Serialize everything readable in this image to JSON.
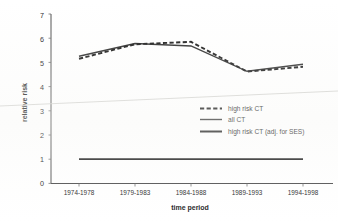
{
  "chart_data": {
    "type": "line",
    "title": "",
    "xlabel": "time period",
    "ylabel": "relative risk",
    "categories": [
      "1974-1978",
      "1979-1983",
      "1984-1988",
      "1989-1993",
      "1994-1998"
    ],
    "ylim": [
      0,
      7
    ],
    "yticks": [
      0,
      1,
      2,
      3,
      4,
      5,
      6,
      7
    ],
    "ytick_labels": [
      "0",
      "1",
      "2",
      "3",
      "4",
      "5",
      "6",
      "7"
    ],
    "grid": false,
    "legend_position": "center-right",
    "series": [
      {
        "name": "high risk CT",
        "style": "dashed",
        "color": "#161616",
        "values": [
          5.15,
          5.75,
          5.85,
          4.62,
          4.82
        ]
      },
      {
        "name": "all CT",
        "style": "solid",
        "color": "#2a2a2a",
        "values": [
          5.25,
          5.78,
          5.68,
          4.63,
          4.92
        ]
      },
      {
        "name": "high risk CT (adj. for SES)",
        "style": "solid-thick",
        "color": "#1c1c1c",
        "values": [
          1.0,
          1.0,
          1.0,
          1.0,
          1.0
        ]
      }
    ]
  },
  "legend": {
    "items": [
      {
        "label": "high risk CT",
        "style": "dashed"
      },
      {
        "label": "all CT",
        "style": "solid"
      },
      {
        "label": "high risk CT (adj. for SES)",
        "style": "solid-thick"
      }
    ]
  },
  "axes": {
    "y_title": "relative risk",
    "x_title": "time period"
  }
}
